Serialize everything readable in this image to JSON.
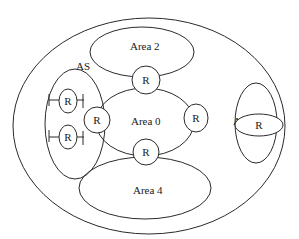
{
  "diagram": {
    "as_label": "AS",
    "areas": [
      {
        "id": "area0",
        "label": "Area 0"
      },
      {
        "id": "area2",
        "label": "Area 2"
      },
      {
        "id": "area3",
        "label": "Area 3"
      },
      {
        "id": "area4",
        "label": "Area 4"
      }
    ],
    "routers": [
      {
        "id": "r-left-top",
        "label": "R"
      },
      {
        "id": "r-left-bottom",
        "label": "R"
      },
      {
        "id": "r-left-border",
        "label": "R"
      },
      {
        "id": "r-top",
        "label": "R"
      },
      {
        "id": "r-right",
        "label": "R"
      },
      {
        "id": "r-bottom",
        "label": "R"
      },
      {
        "id": "r-area3",
        "label": "R"
      }
    ],
    "colors": {
      "stroke": "#2a2a2a",
      "background": "#ffffff"
    }
  }
}
